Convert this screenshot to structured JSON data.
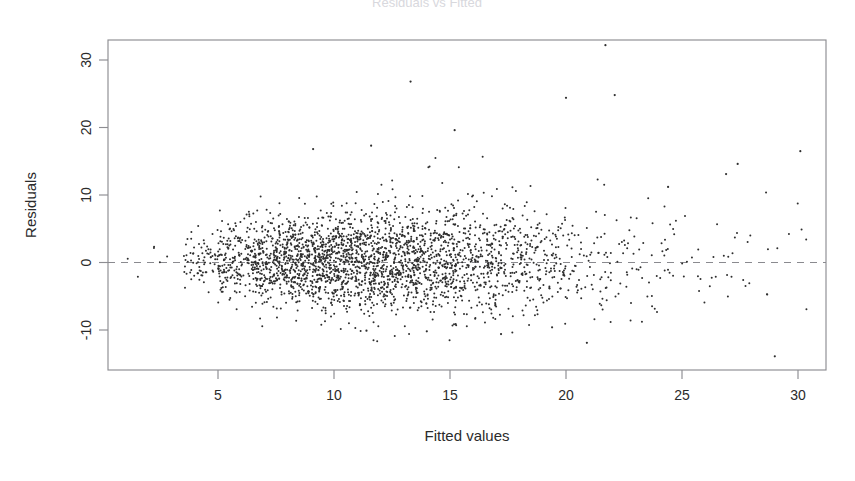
{
  "figure": {
    "kind": "residual-diagnostic-plot",
    "title": "Residuals vs Fitted",
    "title_visible": "partially cropped at top edge",
    "background_color": "#ffffff",
    "point_color": "#2e2e2e",
    "axis_color": "#8d8d92",
    "zero_line_color": "#8a8a8f"
  },
  "chart_data": {
    "type": "scatter",
    "title": "Residuals vs Fitted",
    "xlabel": "Fitted values",
    "ylabel": "Residuals",
    "xlim": [
      0.6,
      31.5
    ],
    "ylim": [
      -15.5,
      34.5
    ],
    "xticks": [
      5,
      10,
      15,
      20,
      25,
      30
    ],
    "xtick_labels": [
      "5",
      "10",
      "15",
      "20",
      "25",
      "30"
    ],
    "yticks": [
      -10,
      0,
      10,
      20,
      30
    ],
    "ytick_labels": [
      "-10",
      "0",
      "10",
      "20",
      "30"
    ],
    "grid": false,
    "legend": false,
    "reference_lines": [
      {
        "orientation": "horizontal",
        "value": 0,
        "style": "dashed",
        "color": "#8a8a8f"
      }
    ],
    "n_points_approx": 3000,
    "marker": {
      "shape": "circle",
      "size_px": 1.0,
      "alpha": 0.85
    },
    "annotations": [],
    "density_bands": [
      {
        "x_start": 1.0,
        "x_end": 3.5,
        "n": 6,
        "spread": 1.2,
        "center": 0.1
      },
      {
        "x_start": 3.5,
        "x_end": 5.0,
        "n": 70,
        "spread": 2.0,
        "center": 0.2
      },
      {
        "x_start": 5.0,
        "x_end": 6.5,
        "n": 180,
        "spread": 2.7,
        "center": 0.1
      },
      {
        "x_start": 6.5,
        "x_end": 8.0,
        "n": 300,
        "spread": 3.1,
        "center": 0.0
      },
      {
        "x_start": 8.0,
        "x_end": 9.5,
        "n": 360,
        "spread": 3.4,
        "center": 0.0
      },
      {
        "x_start": 9.5,
        "x_end": 11.0,
        "n": 380,
        "spread": 3.6,
        "center": 0.0
      },
      {
        "x_start": 11.0,
        "x_end": 12.5,
        "n": 360,
        "spread": 3.7,
        "center": 0.0
      },
      {
        "x_start": 12.5,
        "x_end": 14.0,
        "n": 320,
        "spread": 3.8,
        "center": 0.0
      },
      {
        "x_start": 14.0,
        "x_end": 15.5,
        "n": 270,
        "spread": 3.8,
        "center": -0.1
      },
      {
        "x_start": 15.5,
        "x_end": 17.0,
        "n": 210,
        "spread": 3.8,
        "center": -0.1
      },
      {
        "x_start": 17.0,
        "x_end": 18.5,
        "n": 160,
        "spread": 3.9,
        "center": -0.1
      },
      {
        "x_start": 18.5,
        "x_end": 20.0,
        "n": 110,
        "spread": 4.0,
        "center": -0.1
      },
      {
        "x_start": 20.0,
        "x_end": 22.0,
        "n": 70,
        "spread": 4.2,
        "center": 0.0
      },
      {
        "x_start": 22.0,
        "x_end": 24.0,
        "n": 40,
        "spread": 4.2,
        "center": 0.1
      },
      {
        "x_start": 24.0,
        "x_end": 26.0,
        "n": 26,
        "spread": 4.4,
        "center": 0.3
      },
      {
        "x_start": 26.0,
        "x_end": 28.0,
        "n": 18,
        "spread": 4.6,
        "center": 0.5
      },
      {
        "x_start": 28.0,
        "x_end": 30.5,
        "n": 10,
        "spread": 5.0,
        "center": 0.5
      }
    ],
    "notable_outliers": [
      {
        "x": 21.7,
        "y": 32.2
      },
      {
        "x": 13.3,
        "y": 26.8
      },
      {
        "x": 20.0,
        "y": 24.4
      },
      {
        "x": 22.1,
        "y": 24.8
      },
      {
        "x": 15.2,
        "y": 19.6
      },
      {
        "x": 11.6,
        "y": 17.3
      },
      {
        "x": 30.1,
        "y": 16.5
      },
      {
        "x": 27.4,
        "y": 14.6
      },
      {
        "x": 26.9,
        "y": 13.1
      },
      {
        "x": 24.4,
        "y": 11.2
      },
      {
        "x": 9.1,
        "y": 16.8
      },
      {
        "x": 29.0,
        "y": -13.9
      },
      {
        "x": 20.9,
        "y": -11.9
      },
      {
        "x": 17.2,
        "y": -10.6
      },
      {
        "x": 14.0,
        "y": -10.2
      },
      {
        "x": 11.4,
        "y": -10.1
      },
      {
        "x": 19.4,
        "y": -9.6
      }
    ]
  },
  "geometry": {
    "plot_left_px": 108,
    "plot_right_px": 826,
    "plot_top_px": 40,
    "plot_bottom_px": 370,
    "x_px_at_0": 102,
    "x_px_per_unit": 23.2,
    "y_px_at_0": 262.5,
    "y_px_per_unit": 6.75
  },
  "labels": {
    "x_axis_title": "Fitted values",
    "y_axis_title": "Residuals",
    "main_title": "Residuals vs Fitted"
  }
}
